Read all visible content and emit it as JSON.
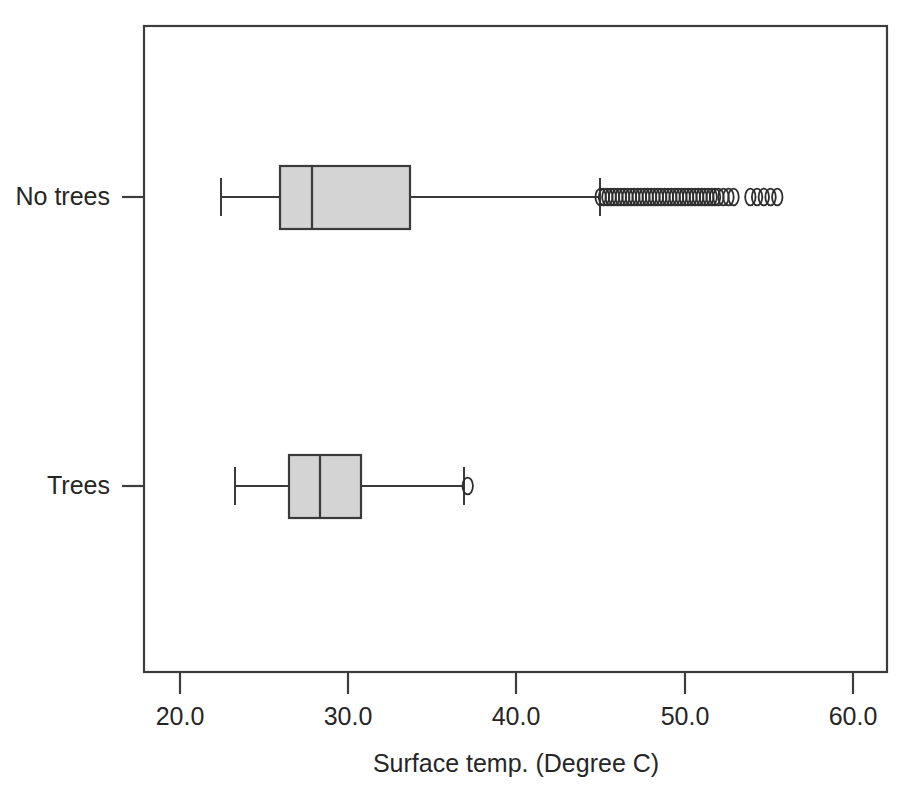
{
  "chart_data": {
    "type": "box",
    "title": "",
    "xlabel": "Surface temp. (Degree C)",
    "ylabel": "",
    "orientation": "horizontal",
    "xlim": [
      17.9,
      61.9
    ],
    "xticks": [
      20.0,
      30.0,
      40.0,
      50.0,
      60.0
    ],
    "xtick_labels": [
      "20.0",
      "30.0",
      "40.0",
      "50.0",
      "60.0"
    ],
    "categories": [
      "No trees",
      "Trees"
    ],
    "grid": false,
    "legend": null,
    "boxes": [
      {
        "category": "No trees",
        "whisker_low": 22.4,
        "q1": 26.0,
        "median": 27.9,
        "q3": 33.7,
        "whisker_high": 45.0,
        "outliers": [
          45.0,
          45.2,
          45.4,
          45.6,
          45.8,
          46.0,
          46.2,
          46.4,
          46.6,
          46.8,
          47.0,
          47.2,
          47.4,
          47.6,
          47.8,
          48.0,
          48.2,
          48.4,
          48.6,
          48.8,
          49.0,
          49.2,
          49.4,
          49.6,
          49.8,
          50.0,
          50.2,
          50.4,
          50.6,
          50.8,
          51.0,
          51.2,
          51.4,
          51.6,
          51.8,
          52.0,
          52.3,
          52.6,
          52.9,
          53.9,
          54.3,
          54.7,
          55.1,
          55.5
        ]
      },
      {
        "category": "Trees",
        "whisker_low": 23.3,
        "q1": 26.5,
        "median": 28.3,
        "q3": 30.8,
        "whisker_high": 37.0,
        "outliers": [
          37.1
        ]
      }
    ]
  },
  "axis": {
    "x_title": "Surface temp. (Degree C)",
    "x_tick_labels": [
      "20.0",
      "30.0",
      "40.0",
      "50.0",
      "60.0"
    ],
    "y_category_labels": [
      "No trees",
      "Trees"
    ]
  },
  "style": {
    "box_fill": "#d4d4d4",
    "line_color": "#3a3a3a",
    "frame_color": "#3d3d3d",
    "background": "#ffffff",
    "text_color": "#262626"
  }
}
